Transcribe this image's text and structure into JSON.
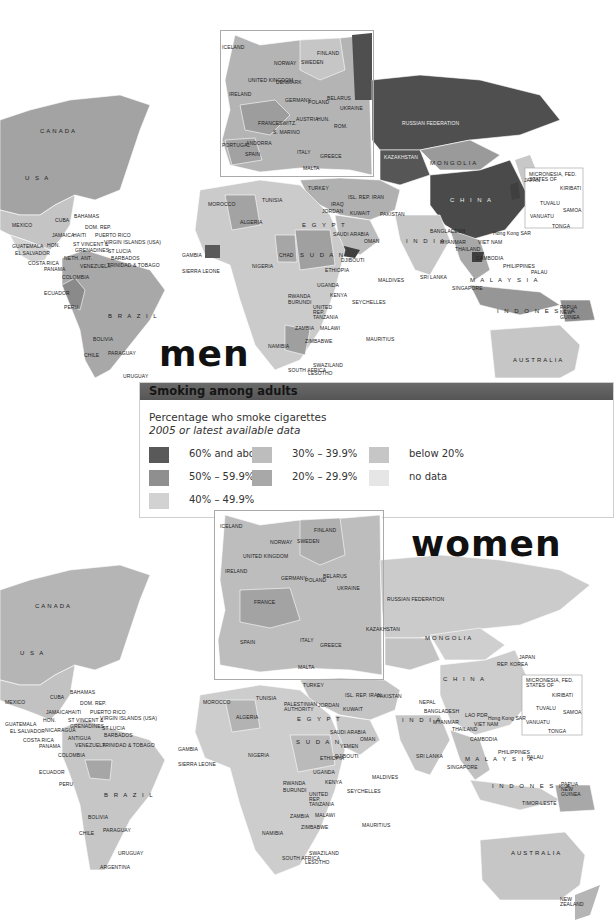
{
  "legend": {
    "title": "Smoking among adults",
    "subtitle": "Percentage who smoke cigarettes",
    "subtitle_italic": "2005 or latest available data",
    "items": [
      {
        "label": "60% and above",
        "color": "#595959"
      },
      {
        "label": "50% – 59.9%",
        "color": "#8f8f8f"
      },
      {
        "label": "40% – 49.9%",
        "color": "#d2d2d2"
      },
      {
        "label": "30% – 39.9%",
        "color": "#bdbdbd"
      },
      {
        "label": "20% – 29.9%",
        "color": "#a8a8a8"
      },
      {
        "label": "below 20%",
        "color": "#c6c6c6"
      },
      {
        "label": "no data",
        "color": "#e6e6e6"
      }
    ]
  },
  "maps": {
    "men": {
      "title": "men",
      "countries": {
        "canada": "CANADA",
        "usa": "U S A",
        "mexico": "MEXICO",
        "cuba": "CUBA",
        "bahamas": "BAHAMAS",
        "dom_rep": "DOM. REP.",
        "jamaica": "JAMAICA",
        "haiti": "HAITI",
        "puerto_rico": "PUERTO RICO",
        "virgin": "VIRGIN ISLANDS (USA)",
        "guatemala": "GUATEMALA",
        "el_salvador": "EL SALVADOR",
        "hon": "HON.",
        "st_vincent": "ST VINCENT &",
        "grenadines": "GRENADINES",
        "st_lucia": "ST LUCIA",
        "barbados": "BARBADOS",
        "costa_rica": "COSTA RICA",
        "panama": "PANAMA",
        "neth_ant": "NETH. ANT.",
        "venezuela": "VENEZUELA",
        "trinidad": "TRINIDAD & TOBAGO",
        "colombia": "COLOMBIA",
        "ecuador": "ECUADOR",
        "peru": "PERU",
        "brazil": "B R A Z I L",
        "bolivia": "BOLIVIA",
        "chile": "CHILE",
        "paraguay": "PARAGUAY",
        "uruguay": "URUGUAY",
        "argentina": "ARGENTINA",
        "iceland": "ICELAND",
        "norway": "NORWAY",
        "sweden": "SWEDEN",
        "finland": "FINLAND",
        "est": "EST.",
        "lat": "LAT.",
        "lith": "LITH.",
        "russ_fed_k": "RUS. FED.",
        "uk": "UNITED KINGDOM",
        "ireland": "IRELAND",
        "denmark": "DENMARK",
        "neth": "NETH.",
        "belgium": "BELGIUM",
        "germany": "GERMANY",
        "poland": "POLAND",
        "belarus": "BELARUS",
        "ukraine": "UKRAINE",
        "lux": "LUX.",
        "france": "FRANCE",
        "switz": "SWITZ.",
        "cz_rep": "CZ. REP.",
        "slo": "SLO.",
        "austria": "AUSTRIA",
        "hun": "HUN.",
        "rep_mol": "REP. MOL.",
        "s_marino": "S. MARINO",
        "croatia": "CROATIA",
        "bh": "B-H",
        "serb_mont": "SERB. MONT.",
        "rom": "ROM.",
        "bul": "BUL.",
        "portugal": "PORTUGAL",
        "andorra": "ANDORRA",
        "spain": "SPAIN",
        "italy": "ITALY",
        "alb": "ALB.",
        "fyr_mac": "F.Y.R. MAC.",
        "greece": "GREECE",
        "malta": "MALTA",
        "russia": "RUSSIAN FEDERATION",
        "kazakhstan": "KAZAKHSTAN",
        "mongolia": "MONGOLIA",
        "china": "C H I N A",
        "kyrg": "KYRG.",
        "uzbek": "UZBEK.",
        "turkmen": "TURKMEN.",
        "turkey": "TURKEY",
        "cyprus": "CYPRUS",
        "israel": "ISRAEL",
        "leb": "LEB.",
        "iraq": "IRAQ",
        "isl_rep_iran": "ISL. REP. IRAN",
        "palestinian": "PALESTINIAN AUTHORITY",
        "jordan": "JORDAN",
        "kuwait": "KUWAIT",
        "bahrain": "BAHRAIN",
        "qatar": "QATAR",
        "uae": "UAE",
        "saudi": "SAUDI ARABIA",
        "oman": "OMAN",
        "yemen": "YEMEN",
        "pakistan": "PAKISTAN",
        "india": "I N D I A",
        "nepal": "NEPAL",
        "bangladesh": "BANGLADESH",
        "myanmar": "MYANMAR",
        "thailand": "THAILAND",
        "lao": "LAO PDR",
        "vietnam": "VIET NAM",
        "cambodia": "CAMBODIA",
        "hong_kong": "Hong Kong SAR",
        "japan": "JAPAN",
        "rep_korea": "REP. KOREA",
        "philippines": "PHILIPPINES",
        "palau": "PALAU",
        "sri_lanka": "SRI LANKA",
        "maldives": "MALDIVES",
        "malaysia": "M A L A Y S I A",
        "singapore": "SINGAPORE",
        "indonesia": "I N D O N E S I A",
        "png": "PAPUA NEW GUINEA",
        "australia": "AUSTRALIA",
        "new_zealand": "NEW ZEALAND",
        "micronesia": "MICRONESIA, FED. STATES OF",
        "nauru": "NAURU",
        "kiribati": "KIRIBATI",
        "tuvalu": "TUVALU",
        "tokelau": "TOKELAU",
        "samoa": "SAMOA",
        "vanuatu": "VANUATU",
        "fiji": "FIJI",
        "cook": "COOK IS.",
        "tonga": "TONGA",
        "niue": "NIUE",
        "morocco": "MOROCCO",
        "tunisia": "TUNISIA",
        "algeria": "ALGERIA",
        "egypt": "E G Y P T",
        "gambia": "GAMBIA",
        "guinea": "GUINEA",
        "sierra_leone": "SIERRA LEONE",
        "cote": "CÔTE D'IVOIRE",
        "ghana": "GHANA",
        "nigeria": "NIGERIA",
        "chad": "CHAD",
        "sudan": "S U D A N",
        "djibouti": "DJIBOUTI",
        "ethiopia": "ETHIOPIA",
        "uganda": "UGANDA",
        "kenya": "KENYA",
        "rwanda": "RWANDA",
        "burundi": "BURUNDI",
        "tanzania": "UNITED REP. TANZANIA",
        "seychelles": "SEYCHELLES",
        "zambia": "ZAMBIA",
        "malawi": "MALAWI",
        "namibia": "NAMIBIA",
        "zimbabwe": "ZIMBABWE",
        "mauritius": "MAURITIUS",
        "swaziland": "SWAZILAND",
        "south_africa": "SOUTH AFRICA",
        "lesotho": "LESOTHO"
      }
    },
    "women": {
      "title": "women",
      "extra": {
        "nicaragua": "NICARAGUA",
        "antigua": "ANTIGUA",
        "timor": "TIMOR-LESTE"
      }
    }
  }
}
